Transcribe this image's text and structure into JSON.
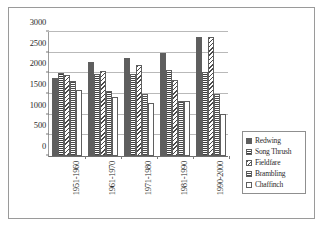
{
  "chart_data": {
    "type": "bar",
    "title": "",
    "subtitle": "",
    "xlabel": "",
    "ylabel": "",
    "ylim": [
      0,
      3000
    ],
    "ytick_step": 500,
    "yticks": [
      "0",
      "500",
      "1000",
      "1500",
      "2000",
      "2500",
      "3000"
    ],
    "grid": true,
    "legend_position": "right",
    "categories": [
      "1951-1960",
      "1961-1970",
      "1971-1980",
      "1981-1990",
      "1990-2000"
    ],
    "series": [
      {
        "name": "Redwing",
        "values": [
          1880,
          2260,
          2350,
          2470,
          2850
        ],
        "swatch": "#5e5e5e",
        "pattern": "solid-dark"
      },
      {
        "name": "Song Thrush",
        "values": [
          2000,
          1970,
          1980,
          2060,
          2010
        ],
        "swatch": "#3f3f3f",
        "pattern": "horizontal-lines"
      },
      {
        "name": "Fieldfare",
        "values": [
          1950,
          2030,
          2180,
          1830,
          2850
        ],
        "swatch": "#4a4a4a",
        "pattern": "diagonal-hatch"
      },
      {
        "name": "Brambling",
        "values": [
          1800,
          1560,
          1500,
          1320,
          1500
        ],
        "swatch": "#4a4a4a",
        "pattern": "horizontal-lines"
      },
      {
        "name": "Chaffinch",
        "values": [
          1580,
          1410,
          1270,
          1330,
          1000
        ],
        "swatch": "#ffffff",
        "pattern": "empty"
      }
    ]
  },
  "legend": {
    "items": [
      "Redwing",
      "Song Thrush",
      "Fieldfare",
      "Brambling",
      "Chaffinch"
    ]
  },
  "colors": {
    "frame_border": "#9a9a9a",
    "gridline": "#b9b9b9",
    "axis": "#6e6e6e",
    "text": "#2b2b2b",
    "background": "#ffffff"
  }
}
